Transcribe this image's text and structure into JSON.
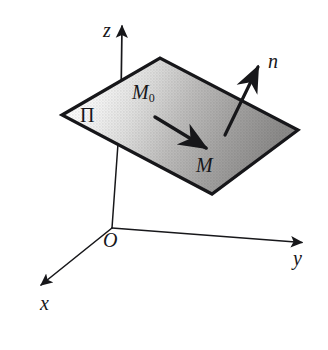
{
  "figure": {
    "background_color": "#ffffff",
    "ink_color": "#17171a",
    "plane_fill_light": "#fdfdfd",
    "plane_fill_dark": "#8d8d8d",
    "labels": {
      "axis_z": "z",
      "axis_y": "y",
      "axis_x": "x",
      "origin": "O",
      "plane": "Π",
      "point_m0_main": "M",
      "point_m0_sub": "0",
      "point_m": "M",
      "normal": "n"
    },
    "geometry": {
      "origin": [
        112,
        228
      ],
      "axis_z_tip": [
        122,
        22
      ],
      "axis_y_tip": [
        307,
        243
      ],
      "axis_x_tip": [
        35,
        290
      ],
      "plane_corner_left": [
        62,
        115
      ],
      "plane_corner_top": [
        160,
        58
      ],
      "plane_corner_right": [
        298,
        130
      ],
      "plane_corner_bottom": [
        212,
        194
      ],
      "vector_m0m_start": [
        155,
        118
      ],
      "vector_m0m_tip": [
        212,
        152
      ],
      "normal_base": [
        225,
        135
      ],
      "normal_tip": [
        261,
        62
      ],
      "hidden_axis_segment_y": [
        85,
        138
      ]
    }
  }
}
